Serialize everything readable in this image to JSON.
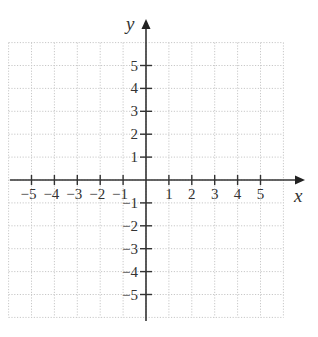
{
  "chart_data": {
    "type": "coordinate-plane",
    "title": "",
    "xlabel": "x",
    "ylabel": "y",
    "xlim": [
      -6,
      6
    ],
    "ylim": [
      -6,
      6
    ],
    "grid": true,
    "grid_style": "dotted",
    "x_ticks": [
      -5,
      -4,
      -3,
      -2,
      -1,
      1,
      2,
      3,
      4,
      5
    ],
    "y_ticks": [
      -5,
      -4,
      -3,
      -2,
      -1,
      1,
      2,
      3,
      4,
      5
    ],
    "x_tick_labels": [
      "−5",
      "−4",
      "−3",
      "−2",
      "−1",
      "1",
      "2",
      "3",
      "4",
      "5"
    ],
    "y_tick_labels": [
      "−5",
      "−4",
      "−3",
      "−2",
      "−1",
      "1",
      "2",
      "3",
      "4",
      "5"
    ],
    "series": []
  },
  "colors": {
    "axis": "#333333",
    "grid": "#c8c8c8",
    "background": "#ffffff"
  },
  "axes": {
    "x_name": "x",
    "y_name": "y"
  }
}
